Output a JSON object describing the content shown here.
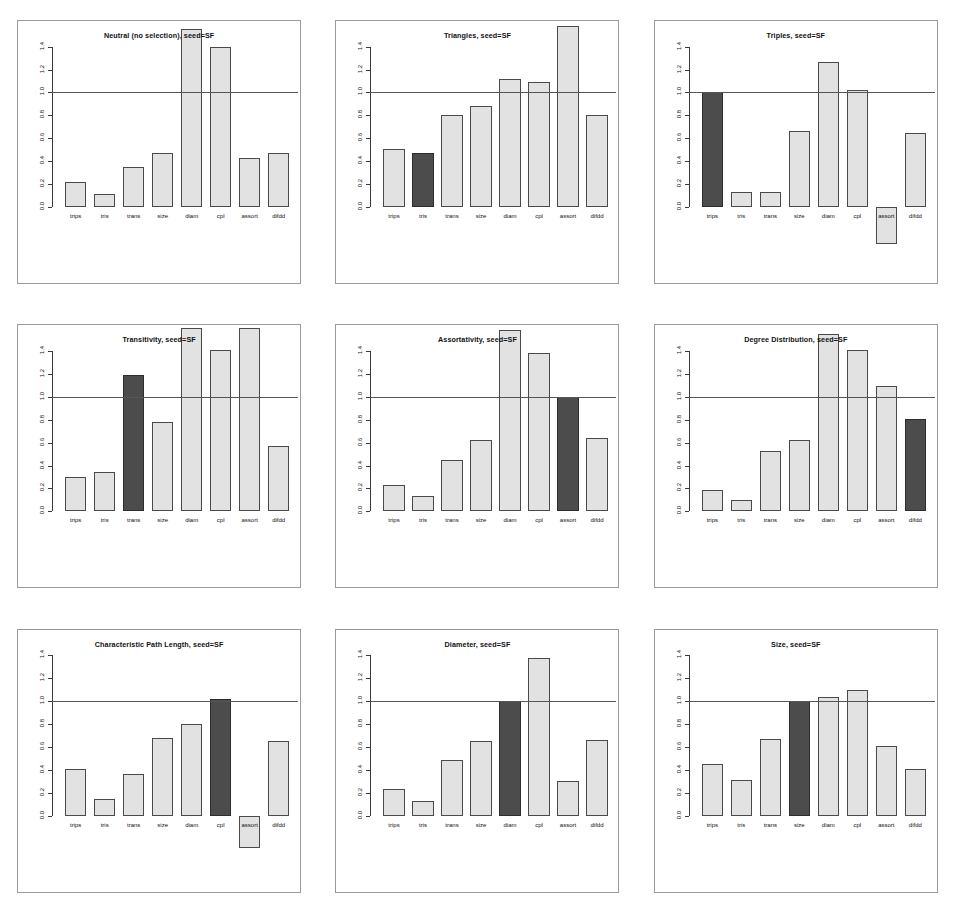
{
  "figure": {
    "panel_count": 9,
    "columns": 3,
    "rows": 3,
    "bar_color_light": "#e2e2e2",
    "bar_color_dark": "#4c4c4c",
    "reference_line_value": 1.0
  },
  "chart_data": [
    {
      "type": "bar",
      "title": "Neutral (no selection), seed=SF",
      "xlabel": "",
      "ylabel": "",
      "ylim": [
        0.0,
        1.5
      ],
      "grid": false,
      "reference_line": 1.0,
      "categories": [
        "trips",
        "tris",
        "trans",
        "size",
        "diam",
        "cpl",
        "assort",
        "difdd"
      ],
      "values": [
        0.22,
        0.11,
        0.35,
        0.47,
        1.55,
        1.4,
        0.43,
        0.47
      ],
      "highlighted": []
    },
    {
      "type": "bar",
      "title": "Triangles, seed=SF",
      "xlabel": "",
      "ylabel": "",
      "ylim": [
        0.0,
        1.5
      ],
      "grid": false,
      "reference_line": 1.0,
      "categories": [
        "trips",
        "tris",
        "trans",
        "size",
        "diam",
        "cpl",
        "assort",
        "difdd"
      ],
      "values": [
        0.51,
        0.47,
        0.8,
        0.88,
        1.12,
        1.09,
        1.58,
        0.8
      ],
      "highlighted": [
        "tris"
      ]
    },
    {
      "type": "bar",
      "title": "Triples, seed=SF",
      "xlabel": "",
      "ylabel": "",
      "ylim": [
        0.0,
        1.5
      ],
      "grid": false,
      "reference_line": 1.0,
      "categories": [
        "trips",
        "tris",
        "trans",
        "size",
        "diam",
        "cpl",
        "assort",
        "difdd"
      ],
      "values": [
        1.0,
        0.13,
        0.13,
        0.66,
        1.27,
        1.02,
        -0.32,
        0.65
      ],
      "highlighted": [
        "trips"
      ]
    },
    {
      "type": "bar",
      "title": "Transitivity, seed=SF",
      "xlabel": "",
      "ylabel": "",
      "ylim": [
        0.0,
        1.5
      ],
      "grid": false,
      "reference_line": 1.0,
      "categories": [
        "trips",
        "tris",
        "trans",
        "size",
        "diam",
        "cpl",
        "assort",
        "difdd"
      ],
      "values": [
        0.3,
        0.34,
        1.19,
        0.78,
        1.6,
        1.41,
        1.6,
        0.57
      ],
      "highlighted": [
        "trans"
      ]
    },
    {
      "type": "bar",
      "title": "Assortativity, seed=SF",
      "xlabel": "",
      "ylabel": "",
      "ylim": [
        0.0,
        1.5
      ],
      "grid": false,
      "reference_line": 1.0,
      "categories": [
        "trips",
        "tris",
        "trans",
        "size",
        "diam",
        "cpl",
        "assort",
        "difdd"
      ],
      "values": [
        0.23,
        0.13,
        0.45,
        0.62,
        1.58,
        1.38,
        1.0,
        0.64
      ],
      "highlighted": [
        "assort"
      ]
    },
    {
      "type": "bar",
      "title": "Degree Distribution, seed=SF",
      "xlabel": "",
      "ylabel": "",
      "ylim": [
        0.0,
        1.5
      ],
      "grid": false,
      "reference_line": 1.0,
      "categories": [
        "trips",
        "tris",
        "trans",
        "size",
        "diam",
        "cpl",
        "assort",
        "difdd"
      ],
      "values": [
        0.19,
        0.1,
        0.53,
        0.62,
        1.55,
        1.41,
        1.09,
        0.81
      ],
      "highlighted": [
        "difdd"
      ]
    },
    {
      "type": "bar",
      "title": "Characteristic Path Length, seed=SF",
      "xlabel": "",
      "ylabel": "",
      "ylim": [
        0.0,
        1.5
      ],
      "grid": false,
      "reference_line": 1.0,
      "categories": [
        "trips",
        "tris",
        "trans",
        "size",
        "diam",
        "cpl",
        "assort",
        "difdd"
      ],
      "values": [
        0.41,
        0.15,
        0.36,
        0.68,
        0.8,
        1.02,
        -0.28,
        0.65
      ],
      "highlighted": [
        "cpl"
      ]
    },
    {
      "type": "bar",
      "title": "Diameter, seed=SF",
      "xlabel": "",
      "ylabel": "",
      "ylim": [
        0.0,
        1.5
      ],
      "grid": false,
      "reference_line": 1.0,
      "categories": [
        "trips",
        "tris",
        "trans",
        "size",
        "diam",
        "cpl",
        "assort",
        "difdd"
      ],
      "values": [
        0.23,
        0.13,
        0.49,
        0.65,
        1.0,
        1.38,
        0.3,
        0.66
      ],
      "highlighted": [
        "diam"
      ]
    },
    {
      "type": "bar",
      "title": "Size, seed=SF",
      "xlabel": "",
      "ylabel": "",
      "ylim": [
        0.0,
        1.5
      ],
      "grid": false,
      "reference_line": 1.0,
      "categories": [
        "trips",
        "tris",
        "trans",
        "size",
        "diam",
        "cpl",
        "assort",
        "difdd"
      ],
      "values": [
        0.45,
        0.31,
        0.67,
        1.0,
        1.04,
        1.1,
        0.61,
        0.41
      ],
      "highlighted": [
        "size"
      ]
    }
  ],
  "y_ticks": [
    "0.0",
    "0.2",
    "0.4",
    "0.6",
    "0.8",
    "1.0",
    "1.2",
    "1.4"
  ],
  "y_tick_values": [
    0.0,
    0.2,
    0.4,
    0.6,
    0.8,
    1.0,
    1.2,
    1.4
  ]
}
